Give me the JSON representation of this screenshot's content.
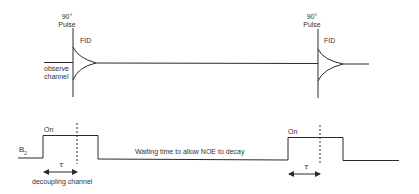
{
  "observe_channel": {
    "pulse1_label_line1": "90°",
    "pulse1_label_line2": "Pulse",
    "pulse1_fid_label": "FID",
    "channel_label_line1": "observe",
    "channel_label_line2": "channel",
    "pulse2_label_line1": "90°",
    "pulse2_label_line2": "Pulse",
    "pulse2_fid_label": "FID"
  },
  "decoupling_channel": {
    "field_label": "B",
    "field_subscript": "2",
    "pulse1_on_label": "On",
    "pulse1_tau_label": "τ",
    "channel_label": "decoupling channel",
    "waiting_label": "Waiting time to allow NOE to decay",
    "pulse2_on_label": "On",
    "pulse2_tau_label": "τ"
  },
  "colors": {
    "line": "#2a2a2a",
    "text": "#333333",
    "background": "#ffffff"
  }
}
